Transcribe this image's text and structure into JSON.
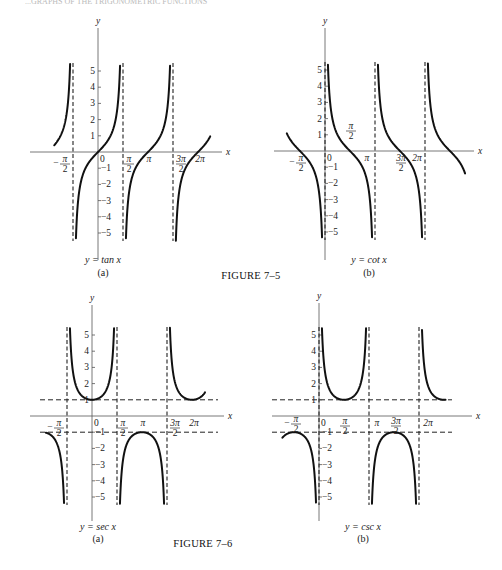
{
  "page": {
    "header_left": "...GRAPHS OF THE TRIGONOMETRIC FUNCTIONS",
    "figure_7_5_caption": "FIGURE 7–5",
    "figure_7_6_caption": "FIGURE 7–6"
  },
  "chart_data": [
    {
      "type": "line",
      "figure": "7-5",
      "panel": "(a)",
      "title": "y = tan x",
      "function": "tan",
      "xlabel": "x",
      "ylabel": "y",
      "x_tick_labels": [
        "−π/2",
        "0",
        "π/2",
        "π",
        "3π/2",
        "2π"
      ],
      "y_tick_labels": [
        "5",
        "4",
        "3",
        "2",
        "1",
        "−1",
        "−2",
        "−3",
        "−4",
        "−5"
      ],
      "ylim": [
        -5.5,
        5.5
      ],
      "xlim": [
        -2.75,
        7.0
      ],
      "asymptotes": [
        "-π/2",
        "π/2",
        "3π/2"
      ],
      "grid": false
    },
    {
      "type": "line",
      "figure": "7-5",
      "panel": "(b)",
      "title": "y = cot x",
      "function": "cot",
      "xlabel": "x",
      "ylabel": "y",
      "x_tick_labels": [
        "−π/2",
        "0",
        "π/2",
        "π",
        "3π/2",
        "2π"
      ],
      "y_tick_labels": [
        "5",
        "4",
        "3",
        "2",
        "1",
        "−1",
        "−2",
        "−3",
        "−4",
        "−5"
      ],
      "ylim": [
        -5.5,
        5.5
      ],
      "xlim": [
        -2.4,
        8.8
      ],
      "asymptotes": [
        "0",
        "π",
        "2π"
      ],
      "grid": false
    },
    {
      "type": "line",
      "figure": "7-6",
      "panel": "(a)",
      "title": "y = sec x",
      "function": "sec",
      "xlabel": "x",
      "ylabel": "y",
      "x_tick_labels": [
        "−π/2",
        "0",
        "π/2",
        "π",
        "3π/2",
        "2π"
      ],
      "y_tick_labels": [
        "5",
        "4",
        "3",
        "2",
        "1",
        "−1",
        "−2",
        "−3",
        "−4",
        "−5"
      ],
      "ylim": [
        -5.5,
        5.5
      ],
      "xlim": [
        -2.9,
        7.1
      ],
      "asymptotes": [
        "-π/2",
        "π/2",
        "3π/2"
      ],
      "reference_lines": [
        "y = 1",
        "y = −1"
      ],
      "grid": false
    },
    {
      "type": "line",
      "figure": "7-6",
      "panel": "(b)",
      "title": "y = csc x",
      "function": "csc",
      "xlabel": "x",
      "ylabel": "y",
      "x_tick_labels": [
        "−π/2",
        "0",
        "π/2",
        "π",
        "3π/2",
        "2π"
      ],
      "y_tick_labels": [
        "5",
        "4",
        "3",
        "2",
        "1",
        "−1",
        "−2",
        "−3",
        "−4",
        "−5"
      ],
      "ylim": [
        -5.5,
        5.5
      ],
      "xlim": [
        -2.3,
        8.0
      ],
      "asymptotes": [
        "0",
        "π",
        "2π"
      ],
      "reference_lines": [
        "y = 1",
        "y = −1"
      ],
      "grid": false
    }
  ],
  "labels": {
    "tan": {
      "caption": "y = tan x",
      "panel": "(a)"
    },
    "cot": {
      "caption": "y = cot x",
      "panel": "(b)"
    },
    "sec": {
      "caption": "y = sec x",
      "panel": "(a)"
    },
    "csc": {
      "caption": "y = csc x",
      "panel": "(b)"
    },
    "x_axis": "x",
    "y_axis": "y",
    "pi": "π",
    "two": "2",
    "three_pi": "3π",
    "two_pi": "2π",
    "minus": "−",
    "zero": "0",
    "y_ticks_pos": [
      "1",
      "2",
      "3",
      "4",
      "5"
    ],
    "y_ticks_neg": [
      "−1",
      "−2",
      "−3",
      "−4",
      "−5"
    ]
  }
}
